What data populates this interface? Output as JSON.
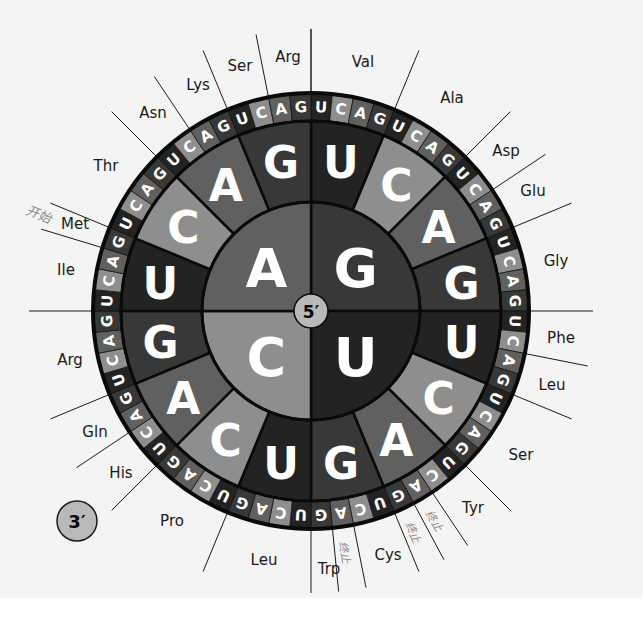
{
  "diagram": {
    "center_label": "5′",
    "end_label": "3′",
    "bases": [
      "U",
      "C",
      "A",
      "G"
    ],
    "colors": {
      "U": "#232323",
      "C": "#8e8e8e",
      "A": "#606060",
      "G": "#383838",
      "border": "#0a0a0a",
      "background": "#f4f4f4",
      "text": "#ffffff",
      "label": "#1a1a1a",
      "annotation": "#8a8a8a"
    },
    "first_base_quadrants": [
      {
        "base": "G",
        "start": 0,
        "end": 90
      },
      {
        "base": "U",
        "start": 90,
        "end": 180
      },
      {
        "base": "C",
        "start": 180,
        "end": 270
      },
      {
        "base": "A",
        "start": 270,
        "end": 360
      }
    ],
    "second_base_order": [
      "U",
      "C",
      "A",
      "G"
    ],
    "third_base_order": [
      "U",
      "C",
      "A",
      "G"
    ],
    "amino_acids": [
      {
        "name": "Val",
        "first": "G",
        "second": "U",
        "thirds": [
          "U",
          "C",
          "A",
          "G"
        ],
        "x": 363,
        "y": 62
      },
      {
        "name": "Ala",
        "first": "G",
        "second": "C",
        "thirds": [
          "U",
          "C",
          "A",
          "G"
        ],
        "x": 452,
        "y": 98
      },
      {
        "name": "Asp",
        "first": "G",
        "second": "A",
        "thirds": [
          "U",
          "C"
        ],
        "x": 506,
        "y": 151
      },
      {
        "name": "Glu",
        "first": "G",
        "second": "A",
        "thirds": [
          "A",
          "G"
        ],
        "x": 533,
        "y": 191
      },
      {
        "name": "Gly",
        "first": "G",
        "second": "G",
        "thirds": [
          "U",
          "C",
          "A",
          "G"
        ],
        "x": 556,
        "y": 261
      },
      {
        "name": "Phe",
        "first": "U",
        "second": "U",
        "thirds": [
          "U",
          "C"
        ],
        "x": 561,
        "y": 338
      },
      {
        "name": "Leu",
        "first": "U",
        "second": "U",
        "thirds": [
          "A",
          "G"
        ],
        "x": 552,
        "y": 385
      },
      {
        "name": "Ser",
        "first": "U",
        "second": "C",
        "thirds": [
          "U",
          "C",
          "A",
          "G"
        ],
        "x": 521,
        "y": 455
      },
      {
        "name": "Tyr",
        "first": "U",
        "second": "A",
        "thirds": [
          "U",
          "C"
        ],
        "x": 473,
        "y": 508
      },
      {
        "name": "终止",
        "first": "U",
        "second": "A",
        "thirds": [
          "A"
        ],
        "stop": true
      },
      {
        "name": "终止",
        "first": "U",
        "second": "A",
        "thirds": [
          "G"
        ],
        "stop": true
      },
      {
        "name": "Cys",
        "first": "U",
        "second": "G",
        "thirds": [
          "U",
          "C"
        ],
        "x": 388,
        "y": 555
      },
      {
        "name": "终止",
        "first": "U",
        "second": "G",
        "thirds": [
          "A"
        ],
        "stop": true
      },
      {
        "name": "Trp",
        "first": "U",
        "second": "G",
        "thirds": [
          "G"
        ],
        "x": 329,
        "y": 569
      },
      {
        "name": "Leu",
        "first": "C",
        "second": "U",
        "thirds": [
          "U",
          "C",
          "A",
          "G"
        ],
        "x": 264,
        "y": 560
      },
      {
        "name": "Pro",
        "first": "C",
        "second": "C",
        "thirds": [
          "U",
          "C",
          "A",
          "G"
        ],
        "x": 172,
        "y": 521
      },
      {
        "name": "His",
        "first": "C",
        "second": "A",
        "thirds": [
          "U",
          "C"
        ],
        "x": 121,
        "y": 473
      },
      {
        "name": "Gln",
        "first": "C",
        "second": "A",
        "thirds": [
          "A",
          "G"
        ],
        "x": 95,
        "y": 432
      },
      {
        "name": "Arg",
        "first": "C",
        "second": "G",
        "thirds": [
          "U",
          "C",
          "A",
          "G"
        ],
        "x": 70,
        "y": 360
      },
      {
        "name": "Ile",
        "first": "A",
        "second": "U",
        "thirds": [
          "U",
          "C",
          "A"
        ],
        "x": 66,
        "y": 270
      },
      {
        "name": "Met",
        "first": "A",
        "second": "U",
        "thirds": [
          "G"
        ],
        "x": 75,
        "y": 224,
        "start": true
      },
      {
        "name": "Thr",
        "first": "A",
        "second": "C",
        "thirds": [
          "U",
          "C",
          "A",
          "G"
        ],
        "x": 106,
        "y": 166
      },
      {
        "name": "Asn",
        "first": "A",
        "second": "A",
        "thirds": [
          "U",
          "C"
        ],
        "x": 153,
        "y": 113
      },
      {
        "name": "Lys",
        "first": "A",
        "second": "A",
        "thirds": [
          "A",
          "G"
        ],
        "x": 198,
        "y": 85
      },
      {
        "name": "Ser",
        "first": "A",
        "second": "G",
        "thirds": [
          "U",
          "C"
        ],
        "x": 240,
        "y": 66
      },
      {
        "name": "Arg",
        "first": "A",
        "second": "G",
        "thirds": [
          "A",
          "G"
        ],
        "x": 288,
        "y": 57
      }
    ],
    "start_annotation": {
      "text": "开始",
      "x": 42,
      "y": 213
    },
    "stop_annotation_text": "终止"
  }
}
